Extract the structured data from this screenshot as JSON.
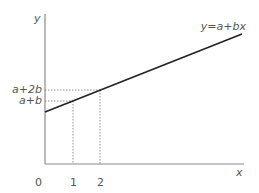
{
  "diagram": {
    "type": "linear-function-graph",
    "axes": {
      "x_label": "x",
      "y_label": "y",
      "origin_label": "0"
    },
    "x_ticks": [
      "1",
      "2"
    ],
    "y_ticks": [
      "a+b",
      "a+2b"
    ],
    "line": {
      "equation_label": "y=a+bx",
      "color": "#222222"
    },
    "colors": {
      "axis": "#888888",
      "guide": "#888888",
      "text": "#555555"
    }
  }
}
